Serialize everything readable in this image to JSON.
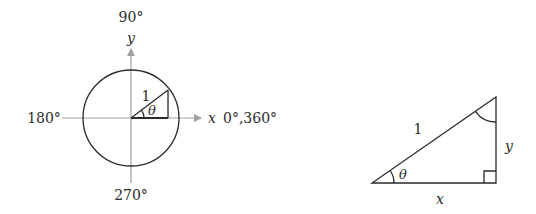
{
  "unit_circle": {
    "angle_labels": {
      "top": "90°",
      "left": "180°",
      "bottom": "270°",
      "right": "0°,360°"
    },
    "axis_labels": {
      "x": "x",
      "y": "y"
    },
    "radius_label": "1",
    "angle_label": "θ",
    "colors": {
      "axis": "#a0a0a0",
      "stroke": "#2a2a2a"
    }
  },
  "right_triangle": {
    "hypotenuse_label": "1",
    "vertical_leg_label": "y",
    "horizontal_leg_label": "x",
    "angle_label": "θ",
    "colors": {
      "stroke": "#2a2a2a"
    }
  }
}
